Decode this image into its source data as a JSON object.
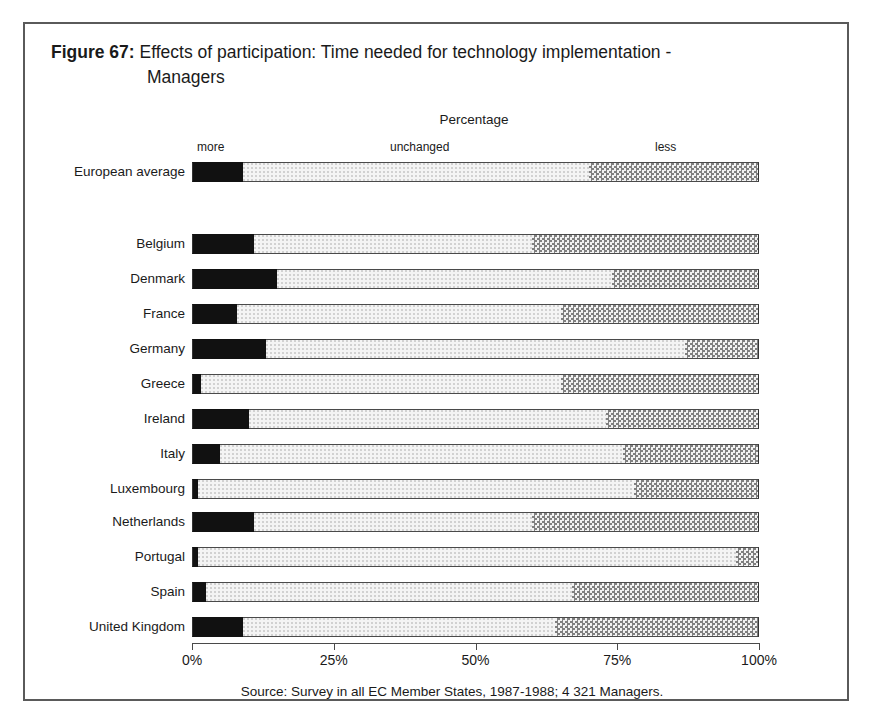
{
  "figure": {
    "number": "Figure 67:",
    "title_line1": "Effects of participation: Time needed for technology implementation -",
    "title_line2": "Managers"
  },
  "axis_caption": "Percentage",
  "legend": {
    "more": "more",
    "unchanged": "unchanged",
    "less": "less"
  },
  "source": "Source: Survey in all EC Member States, 1987-1988; 4 321 Managers.",
  "colors": {
    "more": "#111111",
    "unchanged": "#f4f4f4",
    "less": "#9a9a9a",
    "frame": "#5a5a5a",
    "text": "#1a1a1a"
  },
  "chart_data": {
    "type": "bar",
    "orientation": "horizontal",
    "stacked": true,
    "stacked_normalized": true,
    "title": "Effects of participation: Time needed for technology implementation - Managers",
    "subtitle": "Percentage",
    "xlabel": "",
    "ylabel": "",
    "xlim": [
      0,
      100
    ],
    "grid": false,
    "legend_position": "top",
    "xticks": [
      "0%",
      "25%",
      "50%",
      "75%",
      "100%"
    ],
    "xtick_values": [
      0,
      25,
      50,
      75,
      100
    ],
    "categories": [
      "European average",
      "Belgium",
      "Denmark",
      "France",
      "Germany",
      "Greece",
      "Ireland",
      "Italy",
      "Luxembourg",
      "Netherlands",
      "Portugal",
      "Spain",
      "United Kingdom"
    ],
    "series": [
      {
        "name": "more",
        "values": [
          9,
          11,
          15,
          8,
          13,
          1.5,
          10,
          5,
          1,
          11,
          1,
          2.5,
          9
        ]
      },
      {
        "name": "unchanged",
        "values": [
          61,
          49,
          59,
          57,
          74,
          63.5,
          63,
          71,
          77,
          49,
          95,
          64.5,
          55
        ]
      },
      {
        "name": "less",
        "values": [
          30,
          40,
          26,
          35,
          13,
          35,
          27,
          24,
          22,
          40,
          4,
          33,
          36
        ]
      }
    ],
    "cumulative_boundaries": [
      {
        "category": "European average",
        "more_end": 9,
        "unchanged_end": 70
      },
      {
        "category": "Belgium",
        "more_end": 11,
        "unchanged_end": 60
      },
      {
        "category": "Denmark",
        "more_end": 15,
        "unchanged_end": 74
      },
      {
        "category": "France",
        "more_end": 8,
        "unchanged_end": 65
      },
      {
        "category": "Germany",
        "more_end": 13,
        "unchanged_end": 87
      },
      {
        "category": "Greece",
        "more_end": 1.5,
        "unchanged_end": 65
      },
      {
        "category": "Ireland",
        "more_end": 10,
        "unchanged_end": 73
      },
      {
        "category": "Italy",
        "more_end": 5,
        "unchanged_end": 76
      },
      {
        "category": "Luxembourg",
        "more_end": 1,
        "unchanged_end": 78
      },
      {
        "category": "Netherlands",
        "more_end": 11,
        "unchanged_end": 60
      },
      {
        "category": "Portugal",
        "more_end": 1,
        "unchanged_end": 96
      },
      {
        "category": "Spain",
        "more_end": 2.5,
        "unchanged_end": 67
      },
      {
        "category": "United Kingdom",
        "more_end": 9,
        "unchanged_end": 64
      }
    ],
    "row_tops": [
      138,
      210,
      245,
      280,
      315,
      350,
      385,
      420,
      455,
      488,
      523,
      558,
      593
    ]
  }
}
